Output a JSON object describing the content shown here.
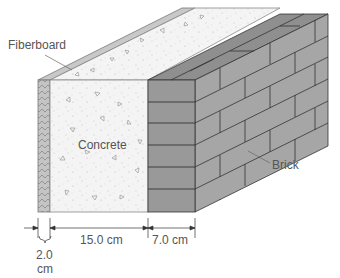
{
  "diagram": {
    "labels": {
      "fiberboard": "Fiberboard",
      "concrete": "Concrete",
      "brick": "Brick"
    },
    "dimensions": {
      "fiberboard": "2.0",
      "fiberboard_unit": "cm",
      "concrete": "15.0 cm",
      "brick": "7.0 cm"
    },
    "layers": [
      {
        "name": "Fiberboard",
        "thickness_cm": 2.0,
        "color": "#bdbdbd"
      },
      {
        "name": "Concrete",
        "thickness_cm": 15.0,
        "color": "#f3f3f3"
      },
      {
        "name": "Brick",
        "thickness_cm": 7.0,
        "color": "#9e9e9e"
      }
    ]
  }
}
